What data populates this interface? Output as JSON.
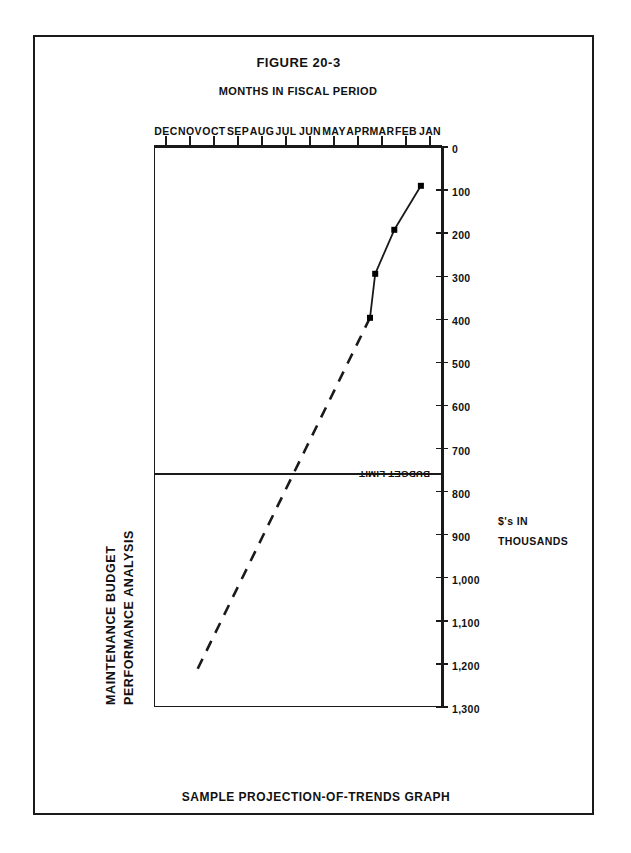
{
  "figure": {
    "number": "FIGURE 20-3",
    "caption": "SAMPLE PROJECTION-OF-TRENDS GRAPH"
  },
  "chart_data": {
    "type": "line",
    "title_line1": "MAINTENANCE  BUDGET",
    "title_line2": "PERFORMANCE  ANALYSIS",
    "title": "MAINTENANCE BUDGET PERFORMANCE ANALYSIS",
    "xlabel": "MONTHS IN FISCAL PERIOD",
    "ylabel_line1": "$'s IN",
    "ylabel_line2": "THOUSANDS",
    "ylabel": "$'s IN THOUSANDS",
    "categories": [
      "JAN",
      "FEB",
      "MAR",
      "APR",
      "MAY",
      "JUN",
      "JUL",
      "AUG",
      "SEP",
      "OCT",
      "NOV",
      "DEC"
    ],
    "ytick_labels": [
      "0",
      "100",
      "200",
      "300",
      "400",
      "500",
      "600",
      "700",
      "800",
      "900",
      "1,000",
      "1,100",
      "1,200",
      "1,300"
    ],
    "yticks": [
      0,
      100,
      200,
      300,
      400,
      500,
      600,
      700,
      800,
      900,
      1000,
      1100,
      1200,
      1300
    ],
    "ylim": [
      0,
      1300
    ],
    "grid": false,
    "legend": "none",
    "series": [
      {
        "name": "Actual cumulative expenditure",
        "style": "solid",
        "markers": true,
        "x": [
          "JAN",
          "FEB",
          "MAR",
          "APR"
        ],
        "values": [
          95,
          215,
          300,
          400
        ]
      },
      {
        "name": "Projected trend",
        "style": "dashed",
        "markers": false,
        "x": [
          "APR",
          "MAY",
          "JUN",
          "JUL",
          "AUG",
          "SEP",
          "OCT",
          "NOV",
          "DEC"
        ],
        "values": [
          400,
          495,
          590,
          685,
          780,
          875,
          970,
          1065,
          1155
        ]
      }
    ],
    "annotations": [
      {
        "name": "budget-limit",
        "label": "BUDGET LIMIT",
        "type": "horizontal-threshold",
        "value": 800
      }
    ],
    "colors": {
      "ink": "#1a1a1a",
      "background": "#ffffff"
    }
  }
}
